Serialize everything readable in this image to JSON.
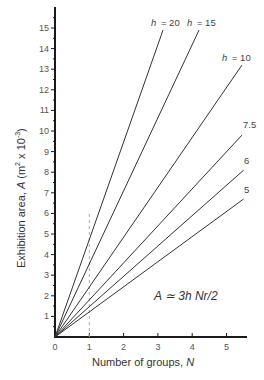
{
  "chart_data": {
    "type": "line",
    "title": "",
    "xlabel": "Number of groups, N",
    "ylabel": "Exhibition area, A (m² x 10⁻³)",
    "xlim": [
      0,
      5.5
    ],
    "ylim": [
      0,
      15.5
    ],
    "x_ticks": [
      0,
      1,
      2,
      3,
      4,
      5
    ],
    "y_ticks": [
      1,
      2,
      3,
      4,
      5,
      6,
      7,
      8,
      9,
      10,
      11,
      12,
      13,
      14,
      15
    ],
    "grid": false,
    "annotation": "A ≃ 3h Nr/2",
    "reference_line": {
      "x": 1,
      "y_range": [
        0,
        6.1
      ],
      "style": "dashed"
    },
    "series": [
      {
        "name": "h = 20",
        "label": "h = 20",
        "x": [
          0,
          3.15
        ],
        "values": [
          0,
          14.9
        ]
      },
      {
        "name": "h = 15",
        "label": "h = 15",
        "x": [
          0,
          4.2
        ],
        "values": [
          0,
          14.9
        ]
      },
      {
        "name": "h = 10",
        "label": "h = 10",
        "x": [
          0,
          5.45
        ],
        "values": [
          0,
          13.2
        ]
      },
      {
        "name": "h = 7.5",
        "label": "7.5",
        "x": [
          0,
          5.45
        ],
        "values": [
          0,
          9.8
        ]
      },
      {
        "name": "h = 6",
        "label": "6",
        "x": [
          0,
          5.5
        ],
        "values": [
          0,
          8.1
        ]
      },
      {
        "name": "h = 5",
        "label": "5",
        "x": [
          0,
          5.5
        ],
        "values": [
          0,
          6.7
        ]
      }
    ]
  },
  "labels": {
    "xlabel_prefix": "Number of groups, ",
    "xlabel_var": "N",
    "ylabel_prefix": "Exhibition area, ",
    "ylabel_var": "A",
    "ylabel_unit_a": " (m",
    "ylabel_sup1": "2",
    "ylabel_unit_b": " x 10",
    "ylabel_sup2": "-3",
    "ylabel_close": ")",
    "formula": "A ≃ 3h Nr/2",
    "h20": "h = 20",
    "h15": "h = 15",
    "h10": "h = 10",
    "h75": "7.5",
    "h6": "6",
    "h5": "5"
  },
  "colors": {
    "axis": "#1a1a1a",
    "line": "#333333",
    "dashed": "#aaaaaa"
  }
}
